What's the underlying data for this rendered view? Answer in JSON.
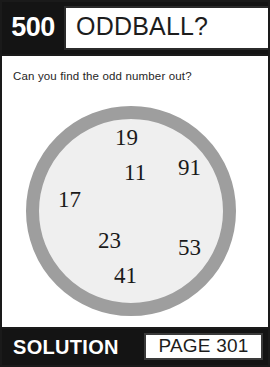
{
  "card": {
    "puzzle_number": "500",
    "title": "ODDBALL?",
    "prompt": "Can you find the odd number out?"
  },
  "puzzle": {
    "shape": "circle",
    "ring_color": "#9e9e9e",
    "fill_color": "#efefef",
    "numbers": [
      {
        "value": "19",
        "x": 89,
        "y": 20
      },
      {
        "value": "91",
        "x": 152,
        "y": 50
      },
      {
        "value": "11",
        "x": 98,
        "y": 55
      },
      {
        "value": "17",
        "x": 32,
        "y": 82
      },
      {
        "value": "23",
        "x": 72,
        "y": 123
      },
      {
        "value": "53",
        "x": 152,
        "y": 130
      },
      {
        "value": "41",
        "x": 88,
        "y": 158
      }
    ]
  },
  "footer": {
    "solution_label": "SOLUTION",
    "page_reference": "PAGE 301"
  }
}
